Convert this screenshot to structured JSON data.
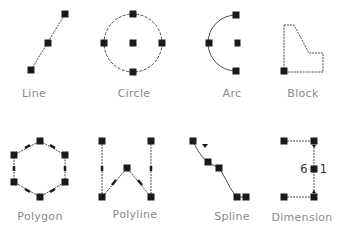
{
  "colors": {
    "background": "#ffffff",
    "handle": "#1a1a1a",
    "stroke": "#4a4a4a",
    "label": "#8a8a8a"
  },
  "tools": [
    {
      "id": "line",
      "label": "Line",
      "icon": "line-icon",
      "label_x": 34,
      "label_y": 87
    },
    {
      "id": "circle",
      "label": "Circle",
      "icon": "circle-icon",
      "label_x": 134,
      "label_y": 87
    },
    {
      "id": "arc",
      "label": "Arc",
      "icon": "arc-icon",
      "label_x": 232,
      "label_y": 87
    },
    {
      "id": "block",
      "label": "Block",
      "icon": "block-icon",
      "label_x": 303,
      "label_y": 87
    },
    {
      "id": "polygon",
      "label": "Polygon",
      "icon": "polygon-icon",
      "label_x": 40,
      "label_y": 210
    },
    {
      "id": "polyline",
      "label": "Polyline",
      "icon": "polyline-icon",
      "label_x": 135,
      "label_y": 208
    },
    {
      "id": "spline",
      "label": "Spline",
      "icon": "spline-icon",
      "label_x": 232,
      "label_y": 210
    },
    {
      "id": "dimension",
      "label": "Dimension",
      "icon": "dimension-icon",
      "label_x": 302,
      "label_y": 211
    }
  ],
  "dimension_value": "6.1"
}
